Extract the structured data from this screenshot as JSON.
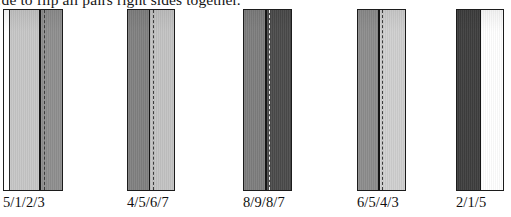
{
  "caption": {
    "text": "…de to flip all pairs right sides together."
  },
  "figure": {
    "name": "fabric-strip-pair-diagrams",
    "colors": {
      "outline": "#1c1c1c",
      "seam_line": "#141414",
      "white": "#ffffff",
      "light_gray": "#c6c6c6",
      "medium_light_gray": "#b4b4b4",
      "medium_gray": "#8e8e8e",
      "dark_gray": "#6f6f6f",
      "darker_gray": "#555555",
      "very_dark_gray": "#3f3f3f"
    },
    "strips": [
      {
        "label": "5/1/2/3",
        "left_px": 3,
        "width_px": 60,
        "edge_panel_width_px": 6,
        "edge_panel_color": "#ffffff",
        "left_panel_color": "#c6c6c6",
        "right_panel_color": "#8e8e8e",
        "seam_pct": 57,
        "stitch_pct": 66,
        "stitch_color": "#3a3a3a"
      },
      {
        "label": "4/5/6/7",
        "left_px": 127,
        "width_px": 48,
        "edge_panel_width_px": 0,
        "edge_panel_color": "#ffffff",
        "left_panel_color": "#808080",
        "right_panel_color": "#c2c2c2",
        "seam_pct": 46,
        "stitch_pct": 56,
        "stitch_color": "#3a3a3a"
      },
      {
        "label": "8/9/8/7",
        "left_px": 243,
        "width_px": 49,
        "edge_panel_width_px": 0,
        "edge_panel_color": "#ffffff",
        "left_panel_color": "#7d7d7d",
        "right_panel_color": "#4a4a4a",
        "seam_pct": 46,
        "stitch_pct": 55,
        "stitch_color": "#e8e8e8"
      },
      {
        "label": "6/5/4/3",
        "left_px": 357,
        "width_px": 49,
        "edge_panel_width_px": 0,
        "edge_panel_color": "#ffffff",
        "left_panel_color": "#8c8c8c",
        "right_panel_color": "#cfcfcf",
        "seam_pct": 44,
        "stitch_pct": 52,
        "stitch_color": "#3a3a3a"
      },
      {
        "label": "2/1/5",
        "left_px": 456,
        "width_px": 48,
        "edge_panel_width_px": 0,
        "edge_panel_color": "#ffffff",
        "left_panel_color": "#3d3d3d",
        "right_panel_color": "#ffffff",
        "seam_pct": 50,
        "stitch_pct": -1,
        "stitch_color": "#3a3a3a"
      }
    ]
  }
}
